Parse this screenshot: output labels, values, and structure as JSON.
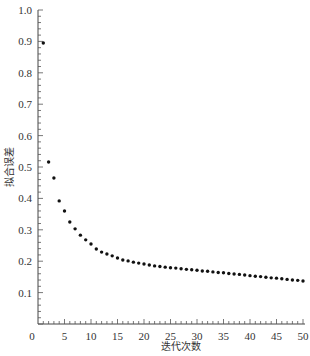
{
  "chart_data": {
    "type": "scatter",
    "title": "",
    "xlabel": "迭代次数",
    "ylabel": "拟合误差",
    "xlim": [
      0,
      50
    ],
    "ylim": [
      0,
      1.0
    ],
    "grid": false,
    "legend": null,
    "x_ticks": [
      0,
      5,
      10,
      15,
      20,
      25,
      30,
      35,
      40,
      45,
      50
    ],
    "x_tick_labels": [
      "0",
      "5",
      "10",
      "15",
      "20",
      "25",
      "30",
      "35",
      "40",
      "45",
      "50"
    ],
    "x_minor_step": 1,
    "y_ticks": [
      0.1,
      0.2,
      0.3,
      0.4,
      0.5,
      0.6,
      0.7,
      0.8,
      0.9,
      1.0
    ],
    "y_tick_labels": [
      "0.1",
      "0.2",
      "0.3",
      "0.4",
      "0.5",
      "0.6",
      "0.7",
      "0.8",
      "0.9",
      "1.0"
    ],
    "y_minor_step": 0.02,
    "series": [
      {
        "name": "拟合误差",
        "x": [
          1,
          2,
          3,
          4,
          5,
          6,
          7,
          8,
          9,
          10,
          11,
          12,
          13,
          14,
          15,
          16,
          17,
          18,
          19,
          20,
          21,
          22,
          23,
          24,
          25,
          26,
          27,
          28,
          29,
          30,
          31,
          32,
          33,
          34,
          35,
          36,
          37,
          38,
          39,
          40,
          41,
          42,
          43,
          44,
          45,
          46,
          47,
          48,
          49,
          50
        ],
        "y": [
          0.895,
          0.516,
          0.465,
          0.392,
          0.36,
          0.325,
          0.303,
          0.283,
          0.268,
          0.255,
          0.239,
          0.229,
          0.223,
          0.217,
          0.21,
          0.204,
          0.201,
          0.197,
          0.194,
          0.191,
          0.188,
          0.185,
          0.183,
          0.181,
          0.179,
          0.178,
          0.176,
          0.174,
          0.173,
          0.171,
          0.169,
          0.168,
          0.166,
          0.164,
          0.163,
          0.161,
          0.159,
          0.158,
          0.156,
          0.154,
          0.152,
          0.151,
          0.149,
          0.147,
          0.146,
          0.144,
          0.142,
          0.14,
          0.139,
          0.137
        ]
      }
    ]
  }
}
